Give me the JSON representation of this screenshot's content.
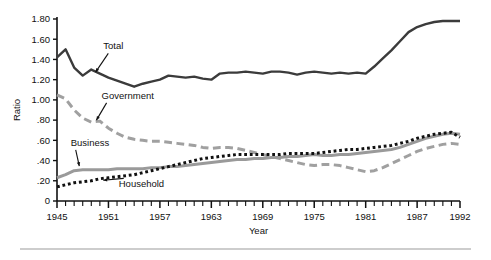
{
  "chart_data": {
    "type": "line",
    "title": "",
    "xlabel": "Year",
    "ylabel": "Ratio",
    "xlim": [
      1945,
      1992
    ],
    "ylim": [
      0,
      1.8
    ],
    "grid": false,
    "legend_position": "inline-annotations",
    "y_ticks": [
      "0",
      ".20",
      ".40",
      ".60",
      ".80",
      "1.00",
      "1.20",
      "1.40",
      "1.60",
      "1.80"
    ],
    "y_tick_values": [
      0,
      0.2,
      0.4,
      0.6,
      0.8,
      1.0,
      1.2,
      1.4,
      1.6,
      1.8
    ],
    "x_ticks": [
      "1945",
      "1951",
      "1957",
      "1963",
      "1969",
      "1975",
      "1981",
      "1987",
      "1992"
    ],
    "x_tick_values": [
      1945,
      1951,
      1957,
      1963,
      1969,
      1975,
      1981,
      1987,
      1992
    ],
    "x_minor_tick_interval": 1,
    "x": [
      1945,
      1946,
      1947,
      1948,
      1949,
      1950,
      1951,
      1952,
      1953,
      1954,
      1955,
      1956,
      1957,
      1958,
      1959,
      1960,
      1961,
      1962,
      1963,
      1964,
      1965,
      1966,
      1967,
      1968,
      1969,
      1970,
      1971,
      1972,
      1973,
      1974,
      1975,
      1976,
      1977,
      1978,
      1979,
      1980,
      1981,
      1982,
      1983,
      1984,
      1985,
      1986,
      1987,
      1988,
      1989,
      1990,
      1991,
      1992
    ],
    "series": [
      {
        "name": "Total",
        "style": "solid",
        "color": "#3b3b3b",
        "width": 2.4,
        "values": [
          1.42,
          1.5,
          1.32,
          1.24,
          1.3,
          1.26,
          1.22,
          1.19,
          1.16,
          1.13,
          1.16,
          1.18,
          1.2,
          1.24,
          1.23,
          1.22,
          1.23,
          1.21,
          1.2,
          1.26,
          1.27,
          1.27,
          1.28,
          1.27,
          1.26,
          1.28,
          1.28,
          1.27,
          1.25,
          1.27,
          1.28,
          1.27,
          1.26,
          1.27,
          1.26,
          1.27,
          1.26,
          1.33,
          1.41,
          1.49,
          1.58,
          1.67,
          1.72,
          1.75,
          1.77,
          1.78,
          1.78,
          1.78
        ]
      },
      {
        "name": "Government",
        "style": "dashed",
        "color": "#a0a0a0",
        "width": 3.0,
        "values": [
          1.05,
          1.01,
          0.9,
          0.82,
          0.78,
          0.79,
          0.72,
          0.67,
          0.63,
          0.61,
          0.6,
          0.59,
          0.59,
          0.58,
          0.57,
          0.56,
          0.55,
          0.53,
          0.52,
          0.53,
          0.53,
          0.52,
          0.5,
          0.48,
          0.46,
          0.44,
          0.42,
          0.4,
          0.38,
          0.36,
          0.35,
          0.36,
          0.36,
          0.35,
          0.33,
          0.31,
          0.29,
          0.3,
          0.33,
          0.37,
          0.41,
          0.45,
          0.49,
          0.52,
          0.54,
          0.56,
          0.57,
          0.56
        ]
      },
      {
        "name": "Business",
        "style": "solid",
        "color": "#9a9a9a",
        "width": 3.0,
        "values": [
          0.23,
          0.26,
          0.3,
          0.31,
          0.31,
          0.31,
          0.31,
          0.32,
          0.32,
          0.32,
          0.32,
          0.33,
          0.33,
          0.34,
          0.34,
          0.35,
          0.36,
          0.37,
          0.38,
          0.39,
          0.4,
          0.41,
          0.41,
          0.42,
          0.42,
          0.43,
          0.43,
          0.44,
          0.44,
          0.45,
          0.46,
          0.45,
          0.45,
          0.46,
          0.46,
          0.47,
          0.48,
          0.49,
          0.5,
          0.51,
          0.53,
          0.56,
          0.59,
          0.62,
          0.64,
          0.66,
          0.67,
          0.66
        ]
      },
      {
        "name": "Household",
        "style": "dotted",
        "color": "#111111",
        "width": 3.0,
        "values": [
          0.14,
          0.16,
          0.18,
          0.19,
          0.2,
          0.22,
          0.23,
          0.24,
          0.25,
          0.26,
          0.28,
          0.3,
          0.32,
          0.34,
          0.36,
          0.38,
          0.4,
          0.42,
          0.43,
          0.44,
          0.45,
          0.46,
          0.46,
          0.46,
          0.46,
          0.46,
          0.46,
          0.47,
          0.47,
          0.47,
          0.47,
          0.48,
          0.49,
          0.5,
          0.51,
          0.51,
          0.52,
          0.53,
          0.54,
          0.55,
          0.57,
          0.59,
          0.62,
          0.64,
          0.66,
          0.67,
          0.68,
          0.63
        ]
      }
    ],
    "annotations": [
      {
        "text": "Total",
        "x": 1950.4,
        "y": 1.5,
        "arrow_to_x": 1949.5,
        "arrow_to_y": 1.275
      },
      {
        "text": "Government",
        "x": 1950.2,
        "y": 1.01,
        "arrow_to_x": 1949.6,
        "arrow_to_y": 0.8
      },
      {
        "text": "Business",
        "x": 1946.6,
        "y": 0.545,
        "arrow_to_x": 1947.6,
        "arrow_to_y": 0.345
      },
      {
        "text": "Household",
        "x": 1952.2,
        "y": 0.135,
        "arrow_to_x": 1950.4,
        "arrow_to_y": 0.205
      }
    ]
  },
  "figure": {
    "y_axis_title": "Ratio",
    "x_axis_title": "Year"
  }
}
